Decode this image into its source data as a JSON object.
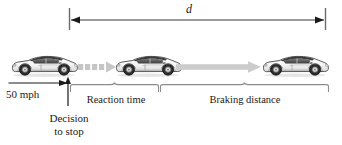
{
  "figure": {
    "total_distance_label": "d",
    "speed_label": "50 mph",
    "decision_label_line1": "Decision",
    "decision_label_line2": "to stop",
    "reaction_label": "Reaction time",
    "braking_label": "Braking distance",
    "cars": [
      {
        "name": "car-at-decision-point",
        "label": ""
      },
      {
        "name": "car-after-reaction-time",
        "label": ""
      },
      {
        "name": "car-stopped",
        "label": ""
      }
    ],
    "icons": {
      "dimension_arrow": "double-headed-arrow-icon",
      "dashed_arrow": "dashed-right-arrow-icon",
      "solid_arrow": "solid-right-arrow-icon",
      "speed_arrow": "right-arrow-icon",
      "decision_pointer": "up-arrow-icon",
      "brace": "underbrace-icon"
    },
    "colors": {
      "ink": "#1a1a1a",
      "rule": "#6b6b6b",
      "brace": "#8c8c8c",
      "arrow_gray": "#c9c9c9",
      "dashed_gray": "#bdbdbd",
      "car_body": "#f2f2f2",
      "car_outline": "#4a4a4a",
      "car_dark": "#2b2b2b"
    }
  }
}
